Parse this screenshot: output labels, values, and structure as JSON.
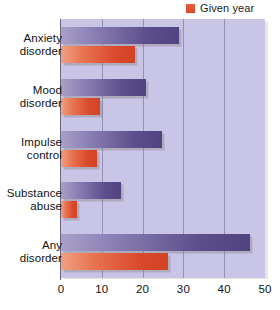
{
  "legend": {
    "position": "top-right",
    "entries": [
      {
        "label": "Given year",
        "color": "#d8472a",
        "series_key": "given_year"
      }
    ]
  },
  "axis": {
    "x_ticks": [
      "0",
      "10",
      "20",
      "30",
      "40",
      "50"
    ],
    "x_min": 0,
    "x_max": 50,
    "grid": true
  },
  "chart_data": {
    "type": "bar",
    "orientation": "horizontal",
    "title": "",
    "subtitle": "",
    "xlabel": "",
    "ylabel": "",
    "xlim": [
      0,
      50
    ],
    "grid": true,
    "legend_position": "top-right",
    "categories": [
      "Anxiety disorder",
      "Mood disorder",
      "Impulse control",
      "Substance abuse",
      "Any disorder"
    ],
    "category_lines": [
      [
        "Anxiety",
        "disorder"
      ],
      [
        "Mood",
        "disorder"
      ],
      [
        "Impulse",
        "control"
      ],
      [
        "Substance",
        "abuse"
      ],
      [
        "Any",
        "disorder"
      ]
    ],
    "series": [
      {
        "name": "Lifetime",
        "color": "#5d4f8c",
        "values": [
          28.8,
          20.8,
          24.8,
          14.6,
          46.4
        ]
      },
      {
        "name": "Given year",
        "color": "#d8472a",
        "values": [
          18.1,
          9.5,
          8.9,
          3.8,
          26.2
        ]
      }
    ],
    "tick_labels": [
      "0",
      "10",
      "20",
      "30",
      "40",
      "50"
    ]
  },
  "colors": {
    "plot_background": "#c8c5e6",
    "page_background": "#ffffff",
    "axis": "#6a6580",
    "gridline": "#8c87a8",
    "series_lifetime": "#5d4f8c",
    "series_given_year": "#d8472a"
  }
}
